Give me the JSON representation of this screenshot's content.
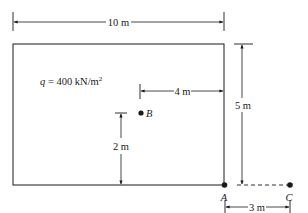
{
  "diagram": {
    "type": "plan-view foundation load",
    "colors": {
      "stroke": "#1a1a1a",
      "background": "#ffffff"
    },
    "load_label": {
      "symbol": "q",
      "eq": " = 400 kN/m",
      "sup": "2"
    },
    "dimensions": {
      "width": "10 m",
      "height": "5 m",
      "b_from_right": "4 m",
      "b_from_bottom": "2 m",
      "a_to_c": "3 m"
    },
    "points": {
      "A": {
        "label": "A"
      },
      "B": {
        "label": "B"
      },
      "C": {
        "label": "C"
      }
    }
  }
}
